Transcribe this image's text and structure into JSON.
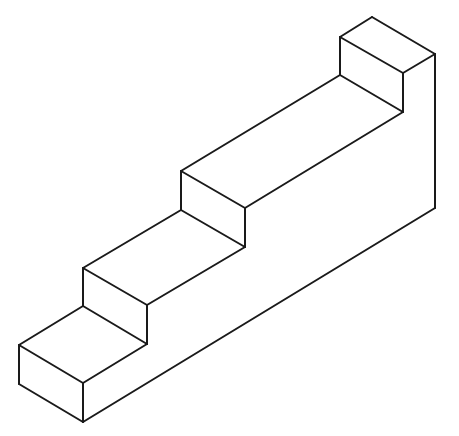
{
  "figure": {
    "type": "isometric line drawing",
    "stroke_color": "#1a1a1a",
    "background": "#ffffff",
    "edges": [
      {
        "name": "top-block-top-back-left",
        "x1": 340,
        "y1": 37,
        "x2": 372,
        "y2": 17
      },
      {
        "name": "top-block-top-back-right",
        "x1": 372,
        "y1": 17,
        "x2": 435,
        "y2": 54
      },
      {
        "name": "top-block-top-front-right",
        "x1": 435,
        "y1": 54,
        "x2": 403,
        "y2": 73
      },
      {
        "name": "top-block-top-front-left",
        "x1": 340,
        "y1": 37,
        "x2": 403,
        "y2": 73
      },
      {
        "name": "top-block-left-vertical",
        "x1": 340,
        "y1": 37,
        "x2": 340,
        "y2": 75
      },
      {
        "name": "top-block-front-vertical",
        "x1": 403,
        "y1": 73,
        "x2": 403,
        "y2": 112
      },
      {
        "name": "back-right-vertical",
        "x1": 435,
        "y1": 54,
        "x2": 435,
        "y2": 208
      },
      {
        "name": "upper-tread-back",
        "x1": 181,
        "y1": 171,
        "x2": 340,
        "y2": 75
      },
      {
        "name": "upper-tread-riser-top",
        "x1": 340,
        "y1": 75,
        "x2": 403,
        "y2": 112
      },
      {
        "name": "upper-tread-front",
        "x1": 245,
        "y1": 208,
        "x2": 403,
        "y2": 112
      },
      {
        "name": "step3-top-front",
        "x1": 181,
        "y1": 171,
        "x2": 245,
        "y2": 208
      },
      {
        "name": "step3-left-vertical",
        "x1": 181,
        "y1": 171,
        "x2": 181,
        "y2": 210
      },
      {
        "name": "step3-front-vertical",
        "x1": 245,
        "y1": 208,
        "x2": 245,
        "y2": 247
      },
      {
        "name": "step2-tread-back",
        "x1": 83,
        "y1": 268,
        "x2": 181,
        "y2": 210
      },
      {
        "name": "step2-riser-base",
        "x1": 181,
        "y1": 210,
        "x2": 245,
        "y2": 247
      },
      {
        "name": "step2-tread-front",
        "x1": 147,
        "y1": 305,
        "x2": 245,
        "y2": 247
      },
      {
        "name": "step2-top-front",
        "x1": 83,
        "y1": 268,
        "x2": 147,
        "y2": 305
      },
      {
        "name": "step2-left-vertical",
        "x1": 83,
        "y1": 268,
        "x2": 83,
        "y2": 306
      },
      {
        "name": "step2-front-vertical",
        "x1": 147,
        "y1": 305,
        "x2": 147,
        "y2": 344
      },
      {
        "name": "step1-tread-back",
        "x1": 19,
        "y1": 345,
        "x2": 83,
        "y2": 306
      },
      {
        "name": "step1-riser-base",
        "x1": 83,
        "y1": 306,
        "x2": 147,
        "y2": 344
      },
      {
        "name": "step1-tread-front",
        "x1": 83,
        "y1": 383,
        "x2": 147,
        "y2": 344
      },
      {
        "name": "step1-top-front",
        "x1": 19,
        "y1": 345,
        "x2": 83,
        "y2": 383
      },
      {
        "name": "step1-left-vertical",
        "x1": 19,
        "y1": 345,
        "x2": 19,
        "y2": 384
      },
      {
        "name": "step1-front-vertical",
        "x1": 83,
        "y1": 383,
        "x2": 83,
        "y2": 422
      },
      {
        "name": "base-left-bottom",
        "x1": 19,
        "y1": 384,
        "x2": 83,
        "y2": 422
      },
      {
        "name": "base-right-bottom",
        "x1": 83,
        "y1": 422,
        "x2": 435,
        "y2": 208
      }
    ]
  }
}
